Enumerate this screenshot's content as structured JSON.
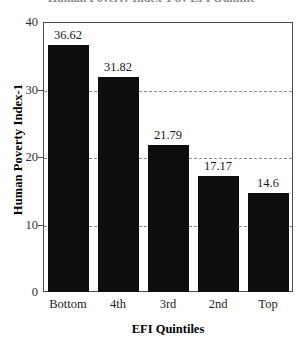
{
  "chart_data": {
    "type": "bar",
    "title": "Human Poverty Index-1 by EFI Quintile",
    "xlabel": "EFI Quintiles",
    "ylabel": "Human Poverty Index-1",
    "categories": [
      "Bottom",
      "4th",
      "3rd",
      "2nd",
      "Top"
    ],
    "values": [
      36.62,
      31.82,
      21.79,
      17.17,
      14.6
    ],
    "value_labels": [
      "36.62",
      "31.82",
      "21.79",
      "17.17",
      "14.6"
    ],
    "ylim": [
      0,
      40
    ],
    "yticks": [
      0,
      10,
      20,
      30,
      40
    ],
    "ytick_labels": [
      "0",
      "10",
      "20",
      "30",
      "40"
    ],
    "gridlines": [
      10,
      20,
      30
    ],
    "grid": true,
    "grid_style": "dashed",
    "legend": "none",
    "series_color": "#0d0d0d",
    "frame_color": "#4a4a52",
    "grid_color": "#8d8d95"
  }
}
